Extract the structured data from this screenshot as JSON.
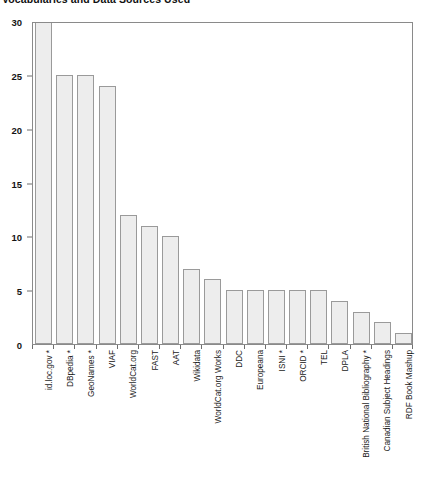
{
  "chart": {
    "title": "Vocabularies and Data Sources Used",
    "type": "bar"
  },
  "chart_data": {
    "type": "bar",
    "title": "Vocabularies and Data Sources Used",
    "xlabel": "",
    "ylabel": "",
    "ylim": [
      0,
      30
    ],
    "grid": false,
    "legend": null,
    "y_ticks": [
      0,
      5,
      10,
      15,
      20,
      25,
      30
    ],
    "categories": [
      "id.loc.gov *",
      "DBpedia *",
      "GeoNames *",
      "VIAF",
      "WorldCat.org",
      "FAST",
      "AAT",
      "Wikidata",
      "WorldCat.org Works",
      "DDC",
      "Europeana",
      "ISNI *",
      "ORCID *",
      "TEL",
      "DPLA",
      "British National Bibliography *",
      "Canadian Subject Headings",
      "RDF Book Mashup"
    ],
    "values": [
      30,
      25,
      25,
      24,
      12,
      11,
      10,
      7,
      6,
      5,
      5,
      5,
      5,
      5,
      4,
      3,
      2,
      1
    ],
    "bar_fill_color": "#ededed",
    "bar_edge_color": "#9a9a9a",
    "axis_color": "#8a8a8a",
    "background_color": "#ffffff"
  }
}
